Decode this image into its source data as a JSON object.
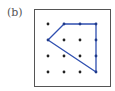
{
  "figure": {
    "label": "(b)",
    "grid": {
      "columns": 4,
      "rows": 4,
      "x_positions": [
        48,
        64,
        80,
        96
      ],
      "y_positions": [
        24,
        40,
        56,
        72
      ],
      "dot_color": "#222222"
    },
    "polygon": {
      "stroke_color": "#2f4fb0",
      "vertex_dot_color": "#1f3a8a",
      "vertices_grid": [
        [
          1,
          0
        ],
        [
          3,
          0
        ],
        [
          3,
          3
        ],
        [
          0,
          1
        ]
      ],
      "points_on_boundary_grid": [
        [
          1,
          0
        ],
        [
          2,
          0
        ],
        [
          3,
          0
        ],
        [
          3,
          1
        ],
        [
          3,
          2
        ],
        [
          3,
          3
        ],
        [
          0,
          1
        ]
      ]
    },
    "colors": {
      "border": "#555555",
      "background": "#ffffff",
      "label": "#555555"
    }
  }
}
